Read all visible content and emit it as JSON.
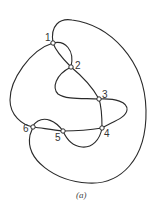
{
  "figure": {
    "caption": "(a)",
    "nodes": [
      {
        "id": "1",
        "label": "1",
        "x": 53,
        "y": 43
      },
      {
        "id": "2",
        "label": "2",
        "x": 71,
        "y": 67
      },
      {
        "id": "3",
        "label": "3",
        "x": 99,
        "y": 99
      },
      {
        "id": "4",
        "label": "4",
        "x": 102,
        "y": 128
      },
      {
        "id": "5",
        "label": "5",
        "x": 63,
        "y": 131
      },
      {
        "id": "6",
        "label": "6",
        "x": 33,
        "y": 127
      }
    ],
    "edges": [
      {
        "from": "1",
        "to": "6",
        "kind": "outer-loop"
      },
      {
        "from": "1",
        "to": "6",
        "kind": "left-arc"
      },
      {
        "from": "1",
        "to": "2",
        "kind": "arc-a"
      },
      {
        "from": "1",
        "to": "2",
        "kind": "arc-b"
      },
      {
        "from": "2",
        "to": "3",
        "kind": "straight"
      },
      {
        "from": "2",
        "to": "3",
        "kind": "left-loop"
      },
      {
        "from": "3",
        "to": "4",
        "kind": "straight"
      },
      {
        "from": "3",
        "to": "4",
        "kind": "right-loop"
      },
      {
        "from": "4",
        "to": "5",
        "kind": "straight"
      },
      {
        "from": "4",
        "to": "5",
        "kind": "lower-arc"
      },
      {
        "from": "5",
        "to": "6",
        "kind": "straight"
      },
      {
        "from": "5",
        "to": "6",
        "kind": "upper-arc"
      }
    ],
    "colors": {
      "stroke": "#2a2a2a",
      "node_fill": "#ffffff",
      "background": "#ffffff"
    }
  }
}
